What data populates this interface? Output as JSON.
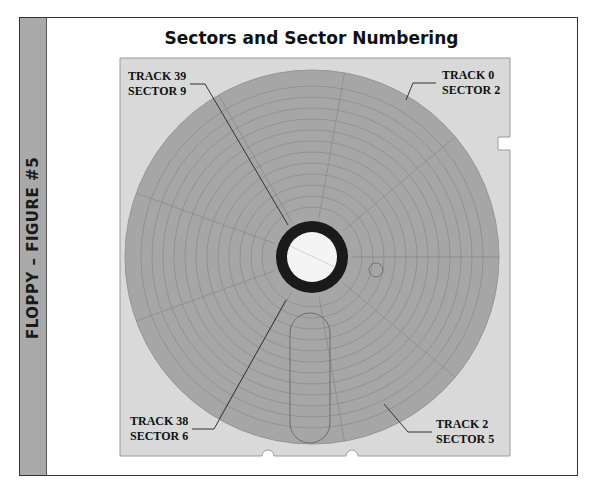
{
  "figure": {
    "side_label": "FLOPPY – FIGURE #5",
    "title": "Sectors and Sector Numbering"
  },
  "labels": [
    {
      "id": "top-left",
      "track": "TRACK 39",
      "sector": "SECTOR 9"
    },
    {
      "id": "top-right",
      "track": "TRACK 0",
      "sector": "SECTOR 2"
    },
    {
      "id": "bottom-left",
      "track": "TRACK 38",
      "sector": "SECTOR 6"
    },
    {
      "id": "bottom-right",
      "track": "TRACK 2",
      "sector": "SECTOR 5"
    }
  ],
  "colors": {
    "sleeve": "#d9d9d9",
    "disk": "#a6a6a6",
    "track_lines": "#8a8a8a",
    "hub_ring": "#1a1a1a",
    "side_band": "#a9a9a9"
  }
}
